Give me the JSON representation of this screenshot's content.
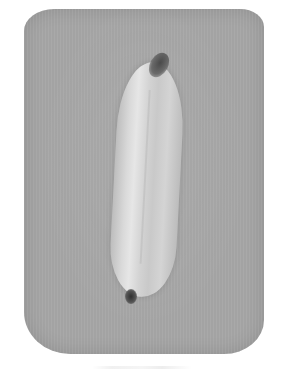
{
  "image": {
    "subject": "banana",
    "description": "Grayscale photo of a single banana lying vertically on a gray rounded-rectangle sheet on a white background",
    "colors": {
      "background": "#ffffff",
      "paper": "#a7a7a7",
      "banana_light": "#e6e6e6",
      "banana_shadow": "#bcbcbc",
      "stem": "#4a4a4a",
      "tip": "#2f2f2f"
    }
  },
  "caption": {
    "text": ""
  }
}
